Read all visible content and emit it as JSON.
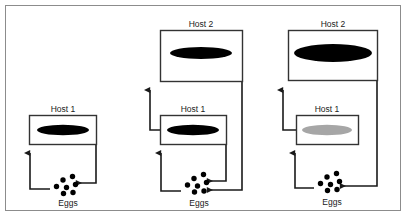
{
  "figure": {
    "border_color": "#8c8c8c",
    "line_color": "#1a1a1a",
    "parasite_dark_color": "#000000",
    "parasite_light_color": "#a6a6a6",
    "box_border_color": "#333333",
    "egg_color": "#000000"
  },
  "panels": [
    {
      "id": "panel-1",
      "name": "single-host-cycle",
      "hosts": [
        {
          "id": "panel1-host1",
          "label": "Host 1",
          "parasite_shade": "dark",
          "level": "lower"
        }
      ],
      "eggs": {
        "label": "Eggs",
        "count": 7
      },
      "arrows": [
        {
          "name": "eggs-to-host1",
          "from": "Eggs",
          "to": "Host 1"
        },
        {
          "name": "host1-to-eggs",
          "from": "Host 1",
          "to": "Eggs"
        }
      ]
    },
    {
      "id": "panel-2",
      "name": "two-host-cycle-dark",
      "hosts": [
        {
          "id": "panel2-host2",
          "label": "Host 2",
          "parasite_shade": "dark",
          "level": "upper"
        },
        {
          "id": "panel2-host1",
          "label": "Host 1",
          "parasite_shade": "dark",
          "level": "lower"
        }
      ],
      "eggs": {
        "label": "Eggs",
        "count": 7
      },
      "arrows": [
        {
          "name": "eggs-to-host1",
          "from": "Eggs",
          "to": "Host 1"
        },
        {
          "name": "host1-to-host2",
          "from": "Host 1",
          "to": "Host 2"
        },
        {
          "name": "host1-to-eggs",
          "from": "Host 1",
          "to": "Eggs"
        },
        {
          "name": "host2-to-eggs",
          "from": "Host 2",
          "to": "Eggs"
        }
      ]
    },
    {
      "id": "panel-3",
      "name": "two-host-cycle-light-host1",
      "hosts": [
        {
          "id": "panel3-host2",
          "label": "Host 2",
          "parasite_shade": "dark",
          "level": "upper"
        },
        {
          "id": "panel3-host1",
          "label": "Host 1",
          "parasite_shade": "light",
          "level": "lower"
        }
      ],
      "eggs": {
        "label": "Eggs",
        "count": 7
      },
      "arrows": [
        {
          "name": "eggs-to-host1",
          "from": "Eggs",
          "to": "Host 1"
        },
        {
          "name": "host1-to-host2",
          "from": "Host 1",
          "to": "Host 2"
        },
        {
          "name": "host2-to-eggs",
          "from": "Host 2",
          "to": "Eggs"
        }
      ]
    }
  ]
}
